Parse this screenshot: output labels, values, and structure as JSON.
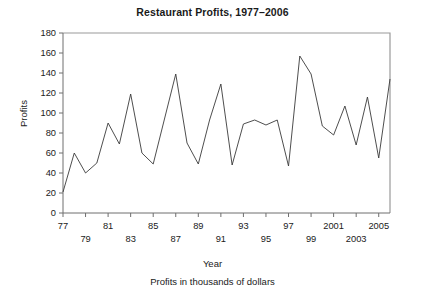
{
  "chart_data": {
    "type": "line",
    "title": "Restaurant Profits, 1977–2006",
    "xlabel": "Year",
    "ylabel": "Profits",
    "caption": "Profits in thousands of dollars",
    "grid": false,
    "legend": "none",
    "xlim": [
      1977,
      2006
    ],
    "ylim": [
      0,
      180
    ],
    "ytick_values": [
      0,
      20,
      40,
      60,
      80,
      100,
      120,
      140,
      160,
      180
    ],
    "ytick_labels": [
      "0",
      "20",
      "40",
      "60",
      "80",
      "100",
      "120",
      "140",
      "160",
      "180"
    ],
    "xtick_values": [
      1977,
      1979,
      1981,
      1983,
      1985,
      1987,
      1989,
      1991,
      1993,
      1995,
      1997,
      1999,
      2001,
      2003,
      2005
    ],
    "xtick_labels": [
      "77",
      "79",
      "81",
      "83",
      "85",
      "87",
      "89",
      "91",
      "93",
      "95",
      "97",
      "99",
      "2001",
      "2003",
      "2005"
    ],
    "xtick_label_rows": [
      0,
      1,
      0,
      1,
      0,
      1,
      0,
      1,
      0,
      1,
      0,
      1,
      0,
      1,
      0
    ],
    "x": [
      1977,
      1978,
      1979,
      1980,
      1981,
      1982,
      1983,
      1984,
      1985,
      1986,
      1987,
      1988,
      1989,
      1990,
      1991,
      1992,
      1993,
      1994,
      1995,
      1996,
      1997,
      1998,
      1999,
      2000,
      2001,
      2002,
      2003,
      2004,
      2005,
      2006
    ],
    "values": [
      21,
      60,
      40,
      50,
      90,
      69,
      119,
      60,
      49,
      94,
      139,
      70,
      49,
      93,
      129,
      48,
      89,
      93,
      88,
      93,
      47,
      157,
      139,
      87,
      78,
      107,
      68,
      116,
      55,
      134
    ],
    "series_name": "Profits",
    "line_color": "#3a3a3a"
  },
  "axis": {
    "y_title": "Profits",
    "x_title": "Year"
  }
}
